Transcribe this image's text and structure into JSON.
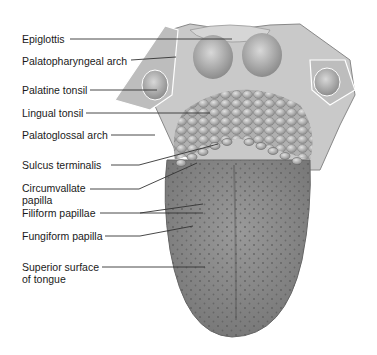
{
  "figure": {
    "labels": [
      {
        "id": "epiglottis",
        "text": "Epiglottis",
        "y": 33,
        "line": [
          [
            70,
            39
          ],
          [
            232,
            39
          ]
        ]
      },
      {
        "id": "palatopharyngeal-arch",
        "text": "Palatopharyngeal arch",
        "y": 55,
        "line": [
          [
            131,
            60
          ],
          [
            176,
            57
          ]
        ]
      },
      {
        "id": "palatine-tonsil",
        "text": "Palatine tonsil",
        "y": 84,
        "line": [
          [
            90,
            90
          ],
          [
            157,
            90
          ]
        ]
      },
      {
        "id": "lingual-tonsil",
        "text": "Lingual tonsil",
        "y": 107,
        "line": [
          [
            86,
            113
          ],
          [
            210,
            113
          ]
        ]
      },
      {
        "id": "palatoglossal-arch",
        "text": "Palatoglossal arch",
        "y": 129,
        "line": [
          [
            111,
            135
          ],
          [
            155,
            135
          ]
        ]
      },
      {
        "id": "sulcus-terminalis",
        "text": "Sulcus terminalis",
        "y": 159,
        "line": [
          [
            111,
            165
          ],
          [
            139,
            165
          ],
          [
            218,
            144
          ]
        ]
      },
      {
        "id": "circumvallate-papilla",
        "text": "Circumvallate",
        "text2": "papilla",
        "y": 180,
        "line": [
          [
            90,
            189
          ],
          [
            139,
            189
          ],
          [
            197,
            163
          ]
        ]
      },
      {
        "id": "filiform-papillae",
        "text": "Filiform papillae",
        "y": 207,
        "line": [
          [
            100,
            213
          ],
          [
            203,
            213
          ]
        ],
        "line2": [
          [
            140,
            213
          ],
          [
            203,
            204
          ]
        ]
      },
      {
        "id": "fungiform-papilla",
        "text": "Fungiform papilla",
        "y": 230,
        "line": [
          [
            105,
            236
          ],
          [
            140,
            236
          ],
          [
            193,
            226
          ]
        ]
      },
      {
        "id": "superior-surface",
        "text": "Superior surface",
        "text2": "of tongue",
        "y": 255,
        "line": [
          [
            102,
            267
          ],
          [
            205,
            267
          ]
        ]
      }
    ],
    "colors": {
      "tongue_fill": "#8d8d8d",
      "tongue_dark": "#6a6a6a",
      "tonsil_fill": "#b5b5b5",
      "arch_fill": "#c4c4c4",
      "line": "#333333",
      "text": "#1a1a1a"
    }
  }
}
